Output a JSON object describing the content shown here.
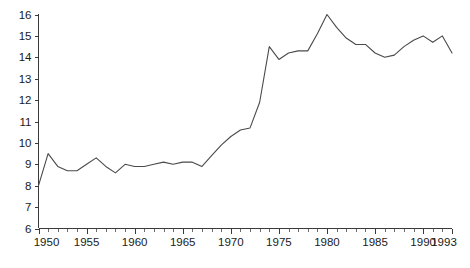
{
  "chart_data": {
    "type": "line",
    "title": "",
    "subtitle": "",
    "xlabel": "",
    "ylabel": "",
    "xlim": [
      1950,
      1993
    ],
    "ylim": [
      6,
      16
    ],
    "grid": false,
    "legend": null,
    "legend_position": "none",
    "line_color": "#4a4a4a",
    "axis_color": "#3a3a3a",
    "background_color": "#ffffff",
    "x_tick_labels": [
      "1950",
      "1955",
      "1960",
      "1965",
      "1970",
      "1975",
      "1980",
      "1985",
      "1990",
      "1993"
    ],
    "x_tick_values": [
      1950,
      1955,
      1960,
      1965,
      1970,
      1975,
      1980,
      1985,
      1990,
      1993
    ],
    "x_minor_tick_interval": 1,
    "y_tick_labels": [
      "6",
      "7",
      "8",
      "9",
      "10",
      "11",
      "12",
      "13",
      "14",
      "15",
      "16"
    ],
    "y_tick_values": [
      6,
      7,
      8,
      9,
      10,
      11,
      12,
      13,
      14,
      15,
      16
    ],
    "series": [
      {
        "name": "series-1",
        "x": [
          1950,
          1951,
          1952,
          1953,
          1954,
          1955,
          1956,
          1957,
          1958,
          1959,
          1960,
          1961,
          1962,
          1963,
          1964,
          1965,
          1966,
          1967,
          1968,
          1969,
          1970,
          1971,
          1972,
          1973,
          1974,
          1975,
          1976,
          1977,
          1978,
          1979,
          1980,
          1981,
          1982,
          1983,
          1984,
          1985,
          1986,
          1987,
          1988,
          1989,
          1990,
          1991,
          1992,
          1993
        ],
        "values": [
          8.0,
          9.5,
          8.9,
          8.7,
          8.7,
          9.0,
          9.3,
          8.9,
          8.6,
          9.0,
          8.9,
          8.9,
          9.0,
          9.1,
          9.0,
          9.1,
          9.1,
          8.9,
          9.4,
          9.9,
          10.3,
          10.6,
          10.7,
          11.9,
          14.5,
          13.9,
          14.2,
          14.3,
          14.3,
          15.1,
          16.0,
          15.4,
          14.9,
          14.6,
          14.6,
          14.2,
          14.0,
          14.1,
          14.5,
          14.8,
          15.0,
          14.7,
          15.0,
          14.2
        ]
      }
    ]
  }
}
